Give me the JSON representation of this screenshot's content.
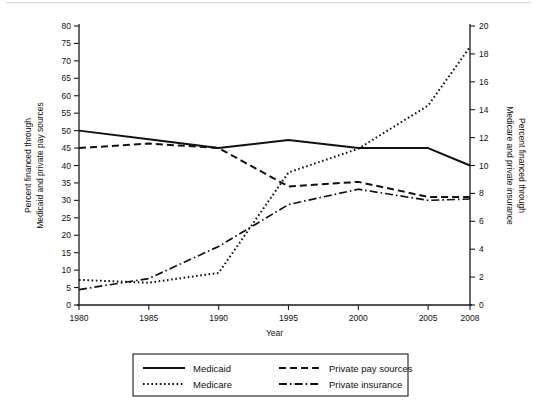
{
  "chart_data": {
    "type": "line",
    "title": "",
    "xlabel": "Year",
    "y_left_label_line1": "Percent financed through",
    "y_left_label_line2": "Medicaid and private pay sources",
    "y_right_label_line1": "Percent financed through",
    "y_right_label_line2": "Medicare and private insurance",
    "x": [
      1980,
      1985,
      1990,
      1995,
      2000,
      2005,
      2008
    ],
    "xtick_labels": [
      "1980",
      "1985",
      "1990",
      "1995",
      "2000",
      "2005",
      "2008"
    ],
    "xlim": [
      1980,
      2008
    ],
    "ylim_left": [
      0,
      80
    ],
    "ytick_left": [
      0,
      5,
      10,
      15,
      20,
      25,
      30,
      35,
      40,
      45,
      50,
      55,
      60,
      65,
      70,
      75,
      80
    ],
    "ytick_left_labels": [
      "0",
      "5",
      "10",
      "15",
      "20",
      "25",
      "30",
      "35",
      "40",
      "45",
      "50",
      "55",
      "60",
      "65",
      "70",
      "75",
      "80"
    ],
    "ylim_right": [
      0,
      20
    ],
    "ytick_right": [
      0,
      2,
      4,
      6,
      8,
      10,
      12,
      14,
      16,
      18,
      20
    ],
    "ytick_right_labels": [
      "0",
      "2",
      "4",
      "6",
      "8",
      "10",
      "12",
      "14",
      "16",
      "18",
      "20"
    ],
    "grid": false,
    "legend_position": "below-center",
    "series": [
      {
        "name": "Medicaid",
        "axis": "left",
        "style": "solid",
        "dash": "none",
        "color": "#111111",
        "width": 2.0,
        "values": [
          50.0,
          47.5,
          45.0,
          47.3,
          45.0,
          45.0,
          40.0
        ]
      },
      {
        "name": "Private pay sources",
        "axis": "left",
        "style": "dashed",
        "dash": "7,4",
        "color": "#111111",
        "width": 2.0,
        "values": [
          45.0,
          46.3,
          45.0,
          34.0,
          35.3,
          31.0,
          31.0
        ]
      },
      {
        "name": "Medicare",
        "axis": "right",
        "style": "dotted",
        "dash": "1.6,2.6",
        "color": "#111111",
        "width": 2.0,
        "values": [
          1.8,
          1.6,
          2.3,
          9.5,
          11.2,
          14.3,
          18.5
        ]
      },
      {
        "name": "Private insurance",
        "axis": "right",
        "style": "dashdot",
        "dash": "8,3,1.6,3",
        "color": "#111111",
        "width": 1.7,
        "values": [
          1.1,
          1.9,
          4.2,
          7.2,
          8.3,
          7.5,
          7.6
        ]
      }
    ],
    "legend_entries": [
      {
        "label": "Medicaid",
        "style": "solid",
        "dash": "none",
        "width": 2.2
      },
      {
        "label": "Private pay sources",
        "style": "dashed",
        "dash": "7,4",
        "width": 2.2
      },
      {
        "label": "Medicare",
        "style": "dotted",
        "dash": "1.6,2.6",
        "width": 2.2
      },
      {
        "label": "Private insurance",
        "style": "dashdot",
        "dash": "8,3,1.6,3",
        "width": 1.8
      }
    ]
  }
}
